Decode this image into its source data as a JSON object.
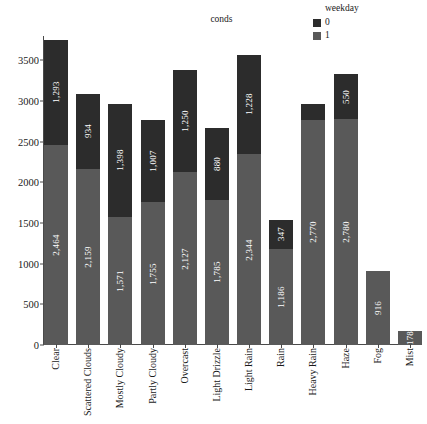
{
  "legend": {
    "title": "weekday",
    "items": [
      {
        "label": "0",
        "color": "#2c2c2c"
      },
      {
        "label": "1",
        "color": "#595959"
      }
    ]
  },
  "plot": {
    "title": "conds"
  },
  "chart_data": {
    "type": "bar",
    "title": "conds",
    "xlabel": "",
    "ylabel": "",
    "stacked": true,
    "grid": false,
    "legend_position": "top-right",
    "legend_title": "weekday",
    "ylim": [
      0,
      3800
    ],
    "yticks": [
      0,
      500,
      1000,
      1500,
      2000,
      2500,
      3000,
      3500
    ],
    "ytick_labels": [
      "0",
      "500",
      "1000",
      "1500",
      "2000",
      "2500",
      "3000",
      "3500"
    ],
    "categories": [
      "Clear",
      "Scattered Clouds",
      "Mostly Cloudy",
      "Partly Cloudy",
      "Overcast",
      "Light Drizzle",
      "Light Rain",
      "Rain",
      "Heavy Rain",
      "Haze",
      "Fog",
      "Mist"
    ],
    "series": [
      {
        "name": "1",
        "color": "#595959",
        "values": [
          2464,
          2159,
          1571,
          1755,
          2127,
          1785,
          2344,
          1186,
          2770,
          2780,
          916,
          178
        ],
        "labels": [
          "2,464",
          "2,159",
          "1,571",
          "1,755",
          "2,127",
          "1,785",
          "2,344",
          "1,186",
          "2,770",
          "2,780",
          "916",
          "178"
        ]
      },
      {
        "name": "0",
        "color": "#2c2c2c",
        "values": [
          1293,
          934,
          1398,
          1007,
          1250,
          880,
          1228,
          347,
          195,
          550,
          0,
          0
        ],
        "labels": [
          "1,293",
          "934",
          "1,398",
          "1,007",
          "1,250",
          "880",
          "1,228",
          "347",
          "",
          "550",
          "",
          ""
        ]
      }
    ],
    "totals": [
      3757,
      3093,
      2969,
      2762,
      3377,
      2665,
      3572,
      1533,
      2965,
      3330,
      916,
      178
    ]
  }
}
